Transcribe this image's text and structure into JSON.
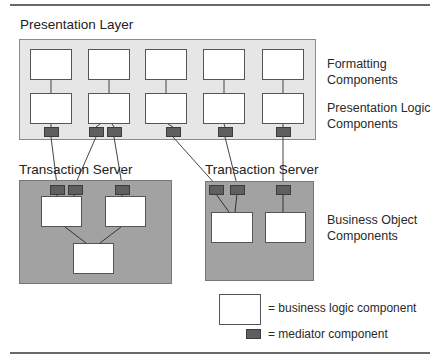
{
  "presentation_layer": {
    "title": "Presentation Layer",
    "columns": 5,
    "row_labels": {
      "formatting": [
        "Formatting",
        "Components"
      ],
      "presentation_logic": [
        "Presentation Logic",
        "Components"
      ]
    }
  },
  "transaction_servers": [
    {
      "title": "Transaction Server",
      "mediators": 3,
      "components": 3
    },
    {
      "title": "Transaction Server",
      "mediators": 3,
      "components": 2
    }
  ],
  "business_object_label": [
    "Business Object",
    "Components"
  ],
  "legend": {
    "business_logic": "= business logic component",
    "mediator": "= mediator component"
  },
  "colors": {
    "presentation_panel": "#e6e6e6",
    "server_panel": "#a2a2a2",
    "mediator": "#5f5f5f",
    "component": "#ffffff"
  }
}
